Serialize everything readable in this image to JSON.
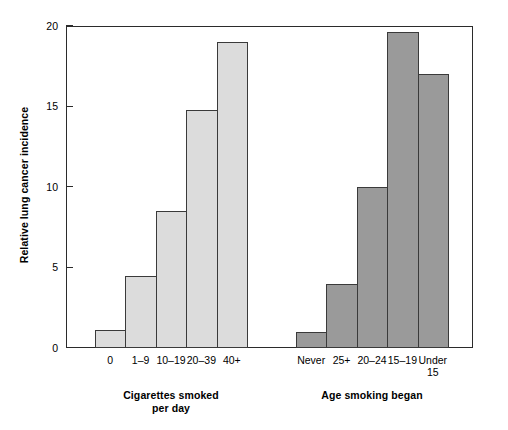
{
  "chart_data": {
    "type": "bar",
    "title": "",
    "xlabel": "",
    "ylabel": "Relative lung cancer incidence",
    "ylim": [
      0,
      20
    ],
    "yticks": [
      0,
      5,
      10,
      15,
      20
    ],
    "grid": false,
    "legend": "none",
    "groups": [
      {
        "caption_line1": "Cigarettes smoked",
        "caption_line2": "per day",
        "caption": "Cigarettes smoked per day",
        "fill_color": "#dcdcdc",
        "edge_color": "#3a3a3a",
        "categories": [
          "0",
          "1–9",
          "10–19",
          "20–39",
          "40+"
        ],
        "values": [
          1.1,
          4.5,
          8.5,
          14.8,
          19.0
        ]
      },
      {
        "caption_line1": "Age smoking began",
        "caption_line2": "",
        "caption": "Age smoking began",
        "fill_color": "#9a9a9a",
        "edge_color": "#3a3a3a",
        "categories": [
          "Never",
          "25+",
          "20–24",
          "15–19",
          "Under 15"
        ],
        "values": [
          1.0,
          4.0,
          10.0,
          19.6,
          17.0
        ]
      }
    ]
  },
  "axis": {
    "y_title": "Relative lung cancer incidence",
    "tick_labels": [
      "0",
      "5",
      "10",
      "15",
      "20"
    ]
  },
  "colors": {
    "frame": "#2b2b2b",
    "bar_light": "#dcdcdc",
    "bar_dark": "#9a9a9a",
    "bar_edge": "#3a3a3a",
    "background": "#ffffff",
    "text": "#000000"
  }
}
